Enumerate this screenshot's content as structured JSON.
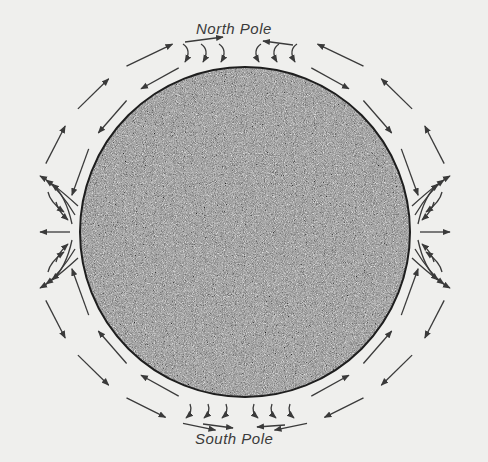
{
  "labels": {
    "north": "North Pole",
    "south": "South Pole"
  },
  "colors": {
    "background": "#efefed",
    "sphere_dark": "#3c3c3c",
    "sphere_light": "#d8d8d8",
    "arrow": "#3a3a3a",
    "label": "#3a3a3a"
  },
  "sphere": {
    "cx": 245,
    "cy": 232,
    "r": 165
  },
  "flows": {
    "outer_ring": {
      "rx": 212,
      "ry": 200,
      "direction": "toward-poles-outside"
    },
    "inner_ring": {
      "rx": 177,
      "ry": 177,
      "direction": "toward-equator-near-surface"
    },
    "equator_fans": [
      "left",
      "right"
    ],
    "pole_hooks": [
      "north",
      "south"
    ]
  }
}
